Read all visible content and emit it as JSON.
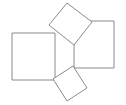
{
  "figure": {
    "background_color": "#ffffff",
    "stroke_color": "#8a8a8a",
    "fill_color": "#ffffff",
    "stroke_width": 1,
    "canvas": {
      "width": 126,
      "height": 105
    },
    "faces": [
      {
        "name": "left-square",
        "label": "",
        "points": "12,33 55,33 55,80 12,80"
      },
      {
        "name": "right-square",
        "label": "",
        "points": "74,21 114,21 114,68 74,68"
      },
      {
        "name": "top-tilted-square",
        "label": "",
        "points": "67,3 92,22 74,45 49,25"
      },
      {
        "name": "bottom-tilted-square",
        "label": "",
        "points": "73,66 87,88 67,101 53,79"
      }
    ]
  }
}
